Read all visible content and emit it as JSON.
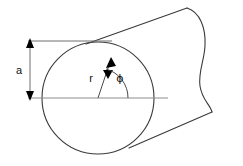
{
  "figure": {
    "type": "technical-line-diagram",
    "canvas": {
      "width": 243,
      "height": 166,
      "background": "#ffffff"
    },
    "colors": {
      "outline": "#3a3a3a",
      "axis": "#8c8c8c",
      "dimension": "#6f6f6f",
      "arrowhead": "#000000",
      "text": "#111111"
    },
    "labels": {
      "radius": "r",
      "angle": "ϕ",
      "outer_radius": "a"
    },
    "geometry": {
      "circle": {
        "cx": 98,
        "cy": 98,
        "r": 56
      },
      "axis_line": {
        "x1": 28,
        "y1": 98,
        "x2": 168,
        "y2": 98
      },
      "top_dim_line": {
        "x1": 28,
        "y1": 41,
        "x2": 112,
        "y2": 41
      },
      "dimension_a": {
        "x": 30,
        "y_top": 41,
        "y_bottom": 98,
        "value_label": "a"
      },
      "radius_arrow": {
        "from_x": 98,
        "from_y": 98,
        "to_x": 110,
        "to_y": 58
      },
      "angle_arc": {
        "center_x": 98,
        "center_y": 98,
        "radius": 30,
        "start_deg": 0,
        "end_deg": 73
      },
      "cylinder_top_edge": {
        "x1": 86,
        "y1": 44,
        "x2": 187,
        "y2": 8
      },
      "cylinder_bottom_edge": {
        "x1": 129,
        "y1": 148,
        "x2": 212,
        "y2": 112
      },
      "break_line_end": "wavy"
    },
    "elements": [
      {
        "name": "circle-cross-section",
        "kind": "circle"
      },
      {
        "name": "cylinder-body",
        "kind": "extruded-tube"
      },
      {
        "name": "break-edge",
        "kind": "wavy-break"
      },
      {
        "name": "center-axis",
        "kind": "centerline"
      },
      {
        "name": "dimension-a",
        "kind": "dimension-with-double-arrow"
      },
      {
        "name": "radius-vector-r",
        "kind": "arrow"
      },
      {
        "name": "angle-phi",
        "kind": "arc-with-label"
      }
    ]
  }
}
